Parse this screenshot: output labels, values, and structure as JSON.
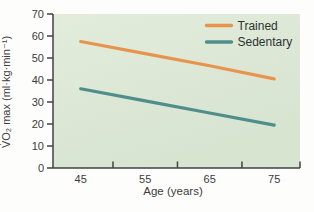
{
  "chart_data": {
    "type": "line",
    "title": "",
    "xlabel": "Age (years)",
    "ylabel": "V̇O₂ max (ml·kg·min⁻¹)",
    "x": [
      45,
      55,
      65,
      75
    ],
    "series": [
      {
        "name": "Trained",
        "color": "#E8944E",
        "values": [
          57.5,
          52.0,
          46.5,
          40.5
        ]
      },
      {
        "name": "Sedentary",
        "color": "#4F8E8A",
        "values": [
          36.0,
          30.5,
          25.0,
          19.5
        ]
      }
    ],
    "xlim": [
      40.7,
      79
    ],
    "ylim": [
      0,
      70
    ],
    "yticks": [
      0,
      10,
      20,
      30,
      40,
      50,
      60,
      70
    ],
    "xtick_labels": [
      "45",
      "55",
      "65",
      "75"
    ],
    "xtick_label_positions": [
      45,
      55,
      65,
      75
    ],
    "xticks_minor": [
      50,
      60,
      70,
      79
    ],
    "grid": false,
    "legend_position": "top-right",
    "legend_items": [
      "Trained",
      "Sedentary"
    ],
    "plot_background_top": "#e3ecdb",
    "plot_background_bottom": "#d6e4d0",
    "axis_color": "#414244",
    "tick_text_color": "#3b3c3e",
    "legend_text_color": "#2f3133"
  }
}
